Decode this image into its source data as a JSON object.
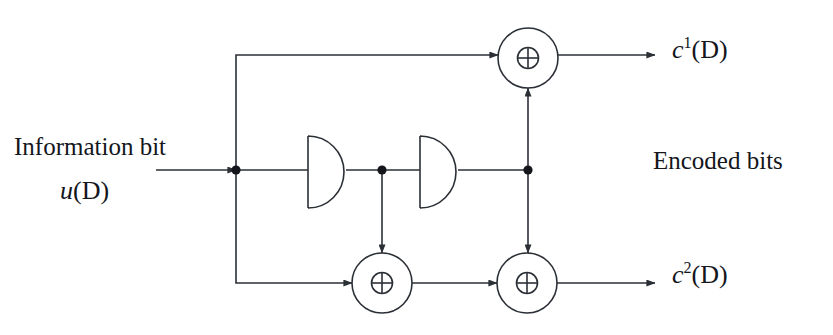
{
  "diagram": {
    "stroke_color": "#2b2f36",
    "background_color": "#ffffff",
    "line_width": 1.6
  },
  "labels": {
    "information_bit": "Information bit",
    "input_signal": {
      "base": "u",
      "arg": "(D)"
    },
    "encoded_bits": "Encoded bits",
    "output_1": {
      "base": "c",
      "superscript": "1",
      "arg": "(D)"
    },
    "output_2": {
      "base": "c",
      "superscript": "2",
      "arg": "(D)"
    }
  },
  "nodes": {
    "xor_top": {
      "label": "⊕",
      "cx": 528,
      "cy": 58,
      "r": 30
    },
    "xor_bottom_left": {
      "label": "⊕",
      "cx": 382,
      "cy": 283,
      "r": 30
    },
    "xor_bottom_right": {
      "label": "⊕",
      "cx": 527,
      "cy": 283,
      "r": 30
    },
    "delay_1": {
      "label": "D",
      "x": 308,
      "y": 136,
      "w": 38,
      "h": 72
    },
    "delay_2": {
      "label": "D",
      "x": 420,
      "y": 136,
      "w": 38,
      "h": 72
    },
    "junction_input": {
      "cx": 236,
      "cy": 170,
      "r": 4.5
    },
    "junction_middle": {
      "cx": 382,
      "cy": 170,
      "r": 4.5
    },
    "junction_right": {
      "cx": 528,
      "cy": 170,
      "r": 4.5
    }
  }
}
